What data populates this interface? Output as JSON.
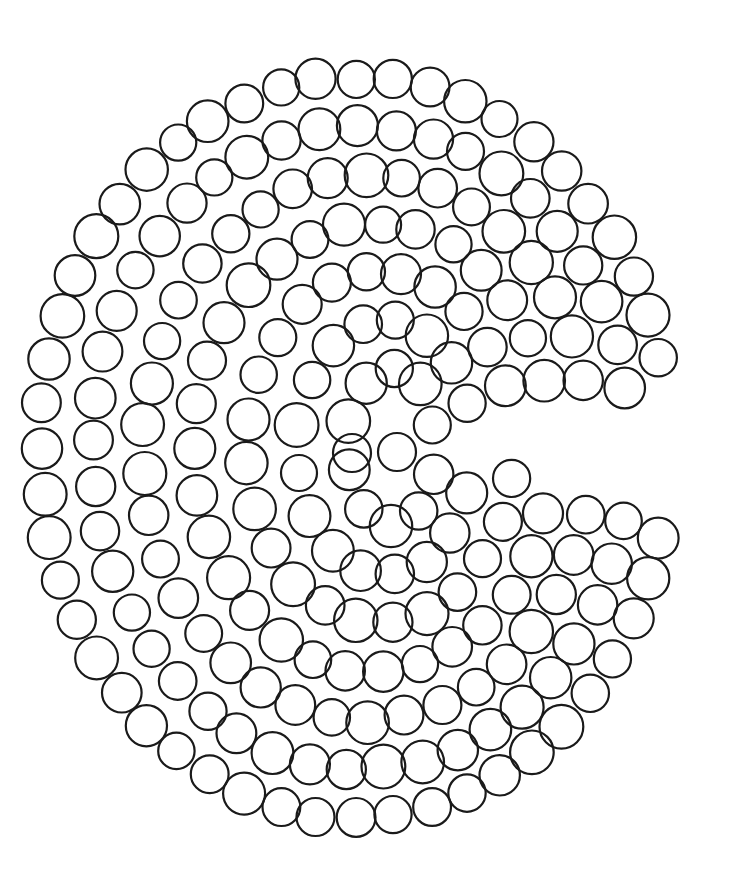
{
  "illustration": {
    "description": "Hand-drawn spiral of outlined circles forming a Pac-Man-like shape with a mouth opening to the right",
    "background_color": "#ffffff",
    "stroke_color": "#1a1a1a",
    "stroke_width": 2.2,
    "circle_radius": 20,
    "circle_spacing": 41,
    "outer_center": [
      355,
      448
    ],
    "inner_center": [
      398,
      448
    ],
    "outer_radii": [
      314,
      370
    ],
    "ring_step": 45,
    "ring_count": 8,
    "mouth": {
      "apex": [
        450,
        450
      ],
      "angle_from_deg": -11,
      "angle_to_deg": 9
    },
    "center_circles": [
      [
        397,
        452
      ],
      [
        352,
        453
      ]
    ]
  }
}
